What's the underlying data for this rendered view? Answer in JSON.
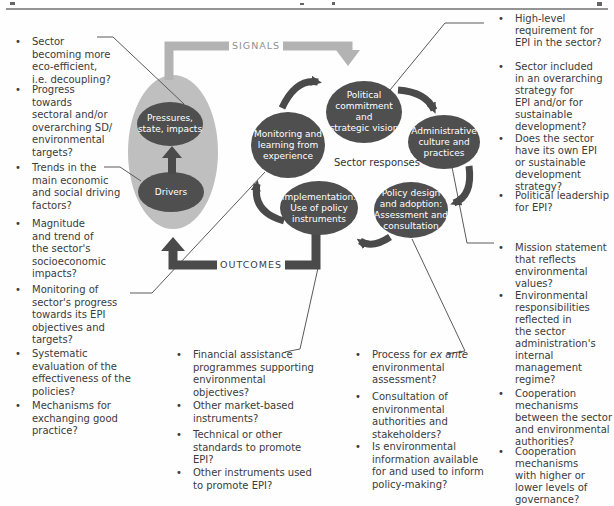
{
  "left_column": {
    "items": [
      "Sector\nbecoming more\neco-efficient,\ni.e. decoupling?",
      "Progress\ntowards\nsectoral and/or\noverarching SD/\nenvironmental\ntargets?",
      "Trends in the\nmain economic\nand social driving\nfactors?",
      "Magnitude\nand trend of\nthe sector's\nsocioeconomic\nimpacts?",
      "Monitoring of\nsector's progress\ntowards its EPI\nobjectives and\ntargets?",
      "Systematic\nevaluation of the\neffectiveness of the\npolicies?",
      "Mechanisms for\nexchanging good\npractice?"
    ]
  },
  "right_column": {
    "items": [
      "High-level\nrequirement for\nEPI in the sector?",
      "Sector included\nin an overarching\nstrategy for\nEPI and/or for\nsustainable\ndevelopment?",
      "Does the sector\nhave its own EPI\nor sustainable\ndevelopment\nstrategy?",
      "Political leadership\nfor EPI?",
      "Mission statement\nthat reflects\nenvironmental\nvalues?",
      "Environmental\nresponsibilities\nreflected in\nthe sector\nadministration's\ninternal\nmanagement\nregime?",
      "Cooperation\nmechanisms\nbetween the sector\nand environmental\nauthorities?",
      "Cooperation\nmechanisms\nwith higher or\nlower levels of\ngovernance?"
    ]
  },
  "bottom_left_column": {
    "items": [
      "Financial assistance\nprogrammes supporting\nenvironmental\nobjectives?",
      "Other market-based\ninstruments?",
      "Technical or other\nstandards to promote\nEPI?",
      "Other instruments used\nto promote EPI?"
    ]
  },
  "bottom_middle_column": {
    "process": {
      "prefix": "Process for ",
      "italic": "ex ante",
      "rest": "\nenvironmental\nassessment?"
    },
    "items": [
      "Consultation of\nenvironmental\nauthorities and\nstakeholders?",
      "Is environmental\ninformation available\nfor and used to inform\npolicy-making?"
    ]
  },
  "diagram": {
    "signals_label": "SIGNALS",
    "outcomes_label": "OUTCOMES",
    "sector_responses_label": "Sector responses",
    "nodes": {
      "pressures": "Pressures,\nstate, impacts",
      "drivers": "Drivers",
      "monitoring": "Monitoring and\nlearning from\nexperience",
      "political": "Political\ncommitment and\nstrategic vision",
      "administrative": "Administrative\nculture and\npractices",
      "policy_design": "Policy design\nand adoption:\nAssessment and\nconsultation",
      "implementation": "Implementation:\nUse of policy\ninstruments"
    },
    "colors": {
      "node_fill": "#4f4f4f",
      "node_text": "#ffffff",
      "environment_fill": "#bfbfbf",
      "signals_arrow": "#b3b3b3",
      "signals_text": "#8f8f8f",
      "dark_arrow": "#4a4a4a",
      "body_text": "#3b3b3b",
      "connector_line": "#5a5a5a",
      "rule": "#949494"
    }
  }
}
